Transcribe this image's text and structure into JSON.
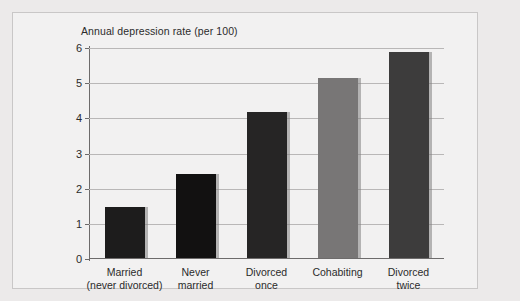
{
  "figure": {
    "title": "Annual depression rate (per 100)",
    "background_color": "#f2f1f1",
    "border_color": "#c9c7c7"
  },
  "chart_data": {
    "type": "bar",
    "title": "Annual depression rate (per 100)",
    "xlabel": "",
    "ylabel": "",
    "ylim": [
      0,
      6
    ],
    "yticks": [
      "0",
      "1",
      "2",
      "3",
      "4",
      "5",
      "6"
    ],
    "grid": true,
    "legend": "none",
    "categories": [
      "Married\n(never divorced)",
      "Never\nmarried",
      "Divorced\nonce",
      "Cohabiting",
      "Divorced\ntwice"
    ],
    "category_lines": [
      [
        "Married",
        "(never divorced)"
      ],
      [
        "Never",
        "married"
      ],
      [
        "Divorced",
        "once"
      ],
      [
        "Cohabiting",
        ""
      ],
      [
        "Divorced",
        "twice"
      ]
    ],
    "values": [
      1.45,
      2.4,
      4.15,
      5.12,
      5.85
    ],
    "bar_colors": [
      "#1d1c1c",
      "#121111",
      "#262525",
      "#787676",
      "#3d3c3c"
    ]
  },
  "colors": {
    "page_background": "#eceaea",
    "axis": "#6d6b6b",
    "gridline": "#b9b7b7",
    "text": "#2b2b2b"
  }
}
